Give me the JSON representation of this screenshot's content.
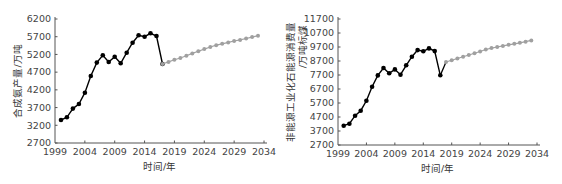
{
  "chart_data": [
    {
      "type": "line",
      "title": "",
      "xlabel": "时间/年",
      "ylabel": "合成氨产量/万吨",
      "ylim": [
        2700,
        6200
      ],
      "yticks": [
        2700,
        3200,
        3700,
        4200,
        4700,
        5200,
        5700,
        6200
      ],
      "xlim": [
        1999,
        2034
      ],
      "xticks": [
        1999,
        2004,
        2009,
        2014,
        2019,
        2024,
        2029,
        2034
      ],
      "grid": false,
      "legend": null,
      "series": [
        {
          "name": "历史",
          "color": "#000000",
          "x": [
            2000,
            2001,
            2002,
            2003,
            2004,
            2005,
            2006,
            2007,
            2008,
            2009,
            2010,
            2011,
            2012,
            2013,
            2014,
            2015,
            2016,
            2017
          ],
          "values": [
            3350,
            3425,
            3670,
            3800,
            4120,
            4590,
            4970,
            5175,
            4985,
            5135,
            4950,
            5250,
            5530,
            5740,
            5700,
            5795,
            5720,
            4930
          ]
        },
        {
          "name": "预测",
          "color": "#a0a0a0",
          "x": [
            2017,
            2018,
            2019,
            2020,
            2021,
            2022,
            2023,
            2024,
            2025,
            2026,
            2027,
            2028,
            2029,
            2030,
            2031,
            2032,
            2033
          ],
          "values": [
            4930,
            4990,
            5050,
            5100,
            5160,
            5230,
            5290,
            5350,
            5410,
            5460,
            5500,
            5540,
            5580,
            5610,
            5650,
            5690,
            5730
          ]
        }
      ]
    },
    {
      "type": "line",
      "title": "",
      "xlabel": "时间/年",
      "ylabel": "非能源工业化石能源消费量/万吨标煤",
      "ylabel_lines": [
        "非能源工业化石能源消费量",
        "/万吨标煤"
      ],
      "ylim": [
        2700,
        11700
      ],
      "yticks": [
        2700,
        3700,
        4700,
        5700,
        6700,
        7700,
        8700,
        9700,
        10700,
        11700
      ],
      "xlim": [
        1999,
        2034
      ],
      "xticks": [
        1999,
        2004,
        2009,
        2014,
        2019,
        2024,
        2029,
        2034
      ],
      "grid": false,
      "legend": null,
      "series": [
        {
          "name": "历史",
          "color": "#000000",
          "x": [
            2000,
            2001,
            2002,
            2003,
            2004,
            2005,
            2006,
            2007,
            2008,
            2009,
            2010,
            2011,
            2012,
            2013,
            2014,
            2015,
            2016,
            2017
          ],
          "values": [
            4080,
            4220,
            4790,
            5150,
            5860,
            6860,
            7670,
            8200,
            7820,
            8100,
            7720,
            8390,
            9010,
            9480,
            9390,
            9600,
            9410,
            7680
          ]
        },
        {
          "name": "预测",
          "color": "#a0a0a0",
          "x": [
            2018,
            2019,
            2020,
            2021,
            2022,
            2023,
            2024,
            2025,
            2026,
            2027,
            2028,
            2029,
            2030,
            2031,
            2032,
            2033
          ],
          "values": [
            8630,
            8760,
            8880,
            9000,
            9130,
            9250,
            9380,
            9520,
            9620,
            9700,
            9780,
            9860,
            9930,
            10000,
            10080,
            10170
          ]
        }
      ],
      "connector": {
        "from": [
          2017,
          7680
        ],
        "to": [
          2018,
          8630
        ],
        "color": "#000000"
      }
    }
  ]
}
